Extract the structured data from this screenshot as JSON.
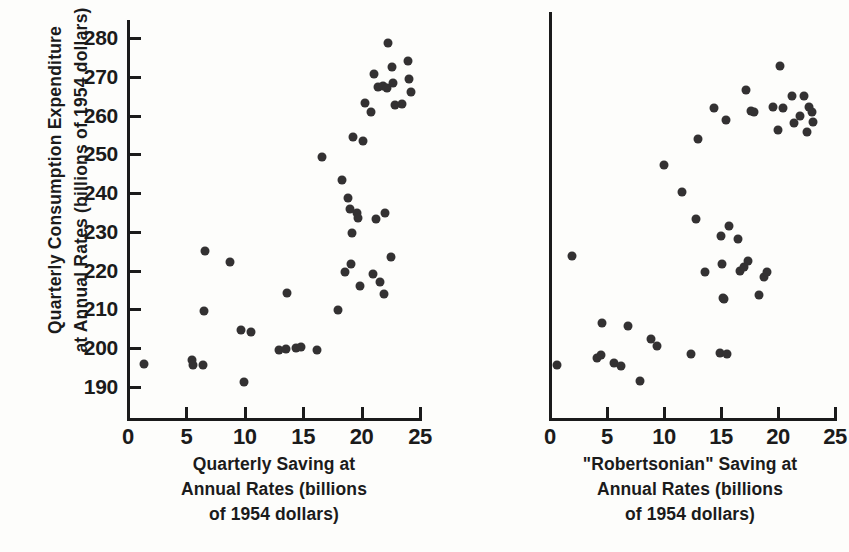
{
  "figure": {
    "background_color": "#fdfdfb",
    "ink_color": "#333132",
    "y_axis_title_line1": "Quarterly Consumption Expenditure",
    "y_axis_title_line2": "at Annual Rates (billions of 1954 dollars)"
  },
  "left_panel": {
    "x_title_line1": "Quarterly Saving at",
    "x_title_line2": "Annual Rates (billions",
    "x_title_line3": "of 1954 dollars)"
  },
  "right_panel": {
    "x_title_line1": "\"Robertsonian\" Saving at",
    "x_title_line2": "Annual Rates (billions",
    "x_title_line3": "of 1954 dollars)"
  },
  "chart_data": [
    {
      "id": "left",
      "type": "scatter",
      "title": "",
      "xlabel": "Quarterly Saving at Annual Rates (billions of 1954 dollars)",
      "ylabel": "Quarterly Consumption Expenditure at Annual Rates (billions of 1954 dollars)",
      "xlim": [
        0,
        25
      ],
      "ylim": [
        185,
        284
      ],
      "xticks": [
        0,
        5,
        10,
        15,
        20,
        25
      ],
      "yticks": [
        190,
        200,
        210,
        220,
        230,
        240,
        250,
        260,
        270,
        280
      ],
      "grid": false,
      "legend": "none",
      "marker": "filled-circle",
      "points": [
        {
          "x": 1.4,
          "y": 196.0
        },
        {
          "x": 5.5,
          "y": 197.0
        },
        {
          "x": 5.6,
          "y": 195.8
        },
        {
          "x": 6.4,
          "y": 195.8
        },
        {
          "x": 6.5,
          "y": 209.6
        },
        {
          "x": 6.6,
          "y": 225.0
        },
        {
          "x": 8.7,
          "y": 222.3
        },
        {
          "x": 9.7,
          "y": 204.8
        },
        {
          "x": 9.9,
          "y": 191.4
        },
        {
          "x": 10.5,
          "y": 204.2
        },
        {
          "x": 12.9,
          "y": 199.5
        },
        {
          "x": 13.5,
          "y": 199.8
        },
        {
          "x": 13.6,
          "y": 214.2
        },
        {
          "x": 14.4,
          "y": 200.1
        },
        {
          "x": 14.8,
          "y": 200.2
        },
        {
          "x": 16.2,
          "y": 199.5
        },
        {
          "x": 16.6,
          "y": 249.2
        },
        {
          "x": 18.0,
          "y": 209.8
        },
        {
          "x": 18.3,
          "y": 243.5
        },
        {
          "x": 18.6,
          "y": 219.6
        },
        {
          "x": 18.8,
          "y": 238.8
        },
        {
          "x": 19.0,
          "y": 236.0
        },
        {
          "x": 19.1,
          "y": 221.8
        },
        {
          "x": 19.2,
          "y": 229.8
        },
        {
          "x": 19.3,
          "y": 254.4
        },
        {
          "x": 19.6,
          "y": 234.8
        },
        {
          "x": 19.7,
          "y": 233.6
        },
        {
          "x": 19.9,
          "y": 216.0
        },
        {
          "x": 20.1,
          "y": 253.4
        },
        {
          "x": 20.3,
          "y": 263.2
        },
        {
          "x": 20.8,
          "y": 261.0
        },
        {
          "x": 21.0,
          "y": 219.1
        },
        {
          "x": 21.1,
          "y": 270.6
        },
        {
          "x": 21.2,
          "y": 233.2
        },
        {
          "x": 21.4,
          "y": 267.4
        },
        {
          "x": 21.6,
          "y": 217.1
        },
        {
          "x": 21.8,
          "y": 267.6
        },
        {
          "x": 21.9,
          "y": 214.0
        },
        {
          "x": 22.0,
          "y": 234.9
        },
        {
          "x": 22.2,
          "y": 267.0
        },
        {
          "x": 22.3,
          "y": 278.8
        },
        {
          "x": 22.5,
          "y": 223.6
        },
        {
          "x": 22.6,
          "y": 272.5
        },
        {
          "x": 22.7,
          "y": 268.4
        },
        {
          "x": 22.9,
          "y": 262.8
        },
        {
          "x": 23.5,
          "y": 263.0
        },
        {
          "x": 24.0,
          "y": 274.0
        },
        {
          "x": 24.1,
          "y": 269.4
        },
        {
          "x": 24.2,
          "y": 266.2
        }
      ]
    },
    {
      "id": "right",
      "type": "scatter",
      "title": "",
      "xlabel": "\"Robertsonian\" Saving at Annual Rates (billions of 1954 dollars)",
      "ylabel": "Quarterly Consumption Expenditure at Annual Rates (billions of 1954 dollars)",
      "xlim": [
        0,
        25
      ],
      "ylim": [
        185,
        284
      ],
      "xticks": [
        0,
        5,
        10,
        15,
        20,
        25
      ],
      "yticks": [
        190,
        200,
        210,
        220,
        230,
        240,
        250,
        260,
        270,
        280
      ],
      "grid": false,
      "legend": "none",
      "marker": "filled-circle",
      "points": [
        {
          "x": 0.6,
          "y": 195.7
        },
        {
          "x": 1.9,
          "y": 223.8
        },
        {
          "x": 4.1,
          "y": 197.4
        },
        {
          "x": 4.5,
          "y": 198.3
        },
        {
          "x": 4.6,
          "y": 206.5
        },
        {
          "x": 5.6,
          "y": 196.1
        },
        {
          "x": 6.2,
          "y": 195.3
        },
        {
          "x": 6.8,
          "y": 205.7
        },
        {
          "x": 7.9,
          "y": 191.5
        },
        {
          "x": 8.9,
          "y": 202.4
        },
        {
          "x": 9.4,
          "y": 200.6
        },
        {
          "x": 10.0,
          "y": 247.3
        },
        {
          "x": 11.6,
          "y": 240.3
        },
        {
          "x": 12.4,
          "y": 198.5
        },
        {
          "x": 12.8,
          "y": 233.4
        },
        {
          "x": 13.0,
          "y": 254.0
        },
        {
          "x": 13.6,
          "y": 219.6
        },
        {
          "x": 14.4,
          "y": 262.0
        },
        {
          "x": 14.9,
          "y": 198.7
        },
        {
          "x": 15.0,
          "y": 228.9
        },
        {
          "x": 15.1,
          "y": 221.6
        },
        {
          "x": 15.2,
          "y": 213.0
        },
        {
          "x": 15.3,
          "y": 212.6
        },
        {
          "x": 15.4,
          "y": 258.8
        },
        {
          "x": 15.5,
          "y": 198.6
        },
        {
          "x": 15.7,
          "y": 231.6
        },
        {
          "x": 16.5,
          "y": 228.2
        },
        {
          "x": 16.7,
          "y": 220.0
        },
        {
          "x": 17.0,
          "y": 221.0
        },
        {
          "x": 17.2,
          "y": 266.6
        },
        {
          "x": 17.4,
          "y": 222.6
        },
        {
          "x": 17.6,
          "y": 261.2
        },
        {
          "x": 17.9,
          "y": 261.0
        },
        {
          "x": 18.3,
          "y": 213.6
        },
        {
          "x": 18.8,
          "y": 218.4
        },
        {
          "x": 19.0,
          "y": 219.6
        },
        {
          "x": 19.6,
          "y": 262.3
        },
        {
          "x": 20.0,
          "y": 256.2
        },
        {
          "x": 20.2,
          "y": 272.8
        },
        {
          "x": 20.4,
          "y": 262.0
        },
        {
          "x": 21.2,
          "y": 265.0
        },
        {
          "x": 21.4,
          "y": 258.2
        },
        {
          "x": 21.9,
          "y": 259.8
        },
        {
          "x": 22.3,
          "y": 265.0
        },
        {
          "x": 22.5,
          "y": 255.8
        },
        {
          "x": 22.7,
          "y": 262.2
        },
        {
          "x": 23.0,
          "y": 260.8
        },
        {
          "x": 23.1,
          "y": 258.4
        }
      ]
    }
  ]
}
